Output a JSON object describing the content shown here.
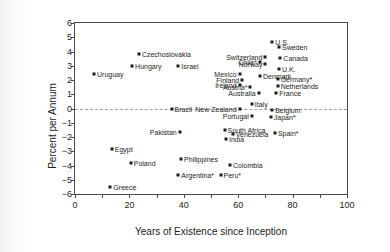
{
  "chart_data": {
    "type": "scatter",
    "title": "",
    "xlabel": "Years of Existence since Inception",
    "ylabel": "Percent per Annum",
    "xlim": [
      0,
      100
    ],
    "ylim": [
      -6,
      6
    ],
    "xticks": [
      0,
      10,
      20,
      30,
      40,
      50,
      60,
      70,
      80,
      90,
      100
    ],
    "xtick_labels": [
      "0",
      "",
      "20",
      "",
      "40",
      "",
      "60",
      "",
      "80",
      "",
      "100"
    ],
    "yticks": [
      6,
      5,
      4,
      3,
      2,
      1,
      0,
      -1,
      -2,
      -3,
      -4,
      -5,
      -6
    ],
    "ytick_labels": [
      "6",
      "5",
      "4",
      "3",
      "2",
      "1",
      "0",
      "−1",
      "−2",
      "−3",
      "−4",
      "−5",
      "−6"
    ],
    "grid": false,
    "legend": "none",
    "annotations": [
      {
        "text": "zero-reference dashed line at y = 0",
        "y": 0
      }
    ],
    "points": [
      {
        "label": "U.S.",
        "x": 72.5,
        "y": 4.7,
        "side": "right"
      },
      {
        "label": "Sweden",
        "x": 75.0,
        "y": 4.3,
        "side": "right"
      },
      {
        "label": "Switzerland",
        "x": 70.0,
        "y": 3.6,
        "side": "left"
      },
      {
        "label": "Canada",
        "x": 75.5,
        "y": 3.55,
        "side": "right"
      },
      {
        "label": "Czechoslovakia",
        "x": 23.5,
        "y": 3.8,
        "side": "right"
      },
      {
        "label": "Chile*",
        "x": 68.0,
        "y": 3.25,
        "side": "left"
      },
      {
        "label": "Norway",
        "x": 70.0,
        "y": 3.1,
        "side": "left"
      },
      {
        "label": "Hungary",
        "x": 21.0,
        "y": 2.95,
        "side": "right"
      },
      {
        "label": "Israel",
        "x": 38.0,
        "y": 2.95,
        "side": "right"
      },
      {
        "label": "U.K.",
        "x": 75.0,
        "y": 2.75,
        "side": "right"
      },
      {
        "label": "Uruguay",
        "x": 7.0,
        "y": 2.45,
        "side": "right"
      },
      {
        "label": "Mexico",
        "x": 60.5,
        "y": 2.4,
        "side": "left"
      },
      {
        "label": "Denmark",
        "x": 68.0,
        "y": 2.3,
        "side": "right"
      },
      {
        "label": "Germany*",
        "x": 74.5,
        "y": 2.05,
        "side": "right"
      },
      {
        "label": "Finland",
        "x": 61.5,
        "y": 2.0,
        "side": "left"
      },
      {
        "label": "Ireland",
        "x": 60.5,
        "y": 1.65,
        "side": "left"
      },
      {
        "label": "Austria*",
        "x": 64.5,
        "y": 1.5,
        "side": "left"
      },
      {
        "label": "Netherlands",
        "x": 74.5,
        "y": 1.55,
        "side": "right"
      },
      {
        "label": "Australia",
        "x": 67.5,
        "y": 1.1,
        "side": "left"
      },
      {
        "label": "France",
        "x": 74.0,
        "y": 1.1,
        "side": "right"
      },
      {
        "label": "Italy",
        "x": 65.0,
        "y": 0.35,
        "side": "right"
      },
      {
        "label": "Brazil",
        "x": 35.5,
        "y": -0.05,
        "side": "right"
      },
      {
        "label": "New Zealand",
        "x": 60.5,
        "y": -0.05,
        "side": "left"
      },
      {
        "label": "Belgium",
        "x": 72.5,
        "y": -0.1,
        "side": "right"
      },
      {
        "label": "Portugal",
        "x": 65.0,
        "y": -0.55,
        "side": "left"
      },
      {
        "label": "Japan*",
        "x": 72.0,
        "y": -0.6,
        "side": "right"
      },
      {
        "label": "South Africa",
        "x": 55.0,
        "y": -1.5,
        "side": "right"
      },
      {
        "label": "Pakistan",
        "x": 38.5,
        "y": -1.65,
        "side": "left"
      },
      {
        "label": "Spain*",
        "x": 73.5,
        "y": -1.7,
        "side": "right"
      },
      {
        "label": "Venezuela",
        "x": 58.0,
        "y": -1.8,
        "side": "right"
      },
      {
        "label": "India",
        "x": 55.5,
        "y": -2.15,
        "side": "right"
      },
      {
        "label": "Egypt",
        "x": 13.5,
        "y": -2.85,
        "side": "right"
      },
      {
        "label": "Philippines",
        "x": 39.0,
        "y": -3.55,
        "side": "right"
      },
      {
        "label": "Poland",
        "x": 20.5,
        "y": -3.8,
        "side": "right"
      },
      {
        "label": "Colombia",
        "x": 57.0,
        "y": -3.95,
        "side": "right"
      },
      {
        "label": "Argentina*",
        "x": 38.0,
        "y": -4.65,
        "side": "right"
      },
      {
        "label": "Peru*",
        "x": 53.5,
        "y": -4.65,
        "side": "right"
      },
      {
        "label": "Greece",
        "x": 13.0,
        "y": -5.5,
        "side": "right"
      }
    ]
  },
  "colors": {
    "marker": "#1d1d1d",
    "axis": "#4a4a4a",
    "zero_line": "#9aa3ad",
    "text": "#1d1d1d",
    "background": "#ffffff"
  }
}
